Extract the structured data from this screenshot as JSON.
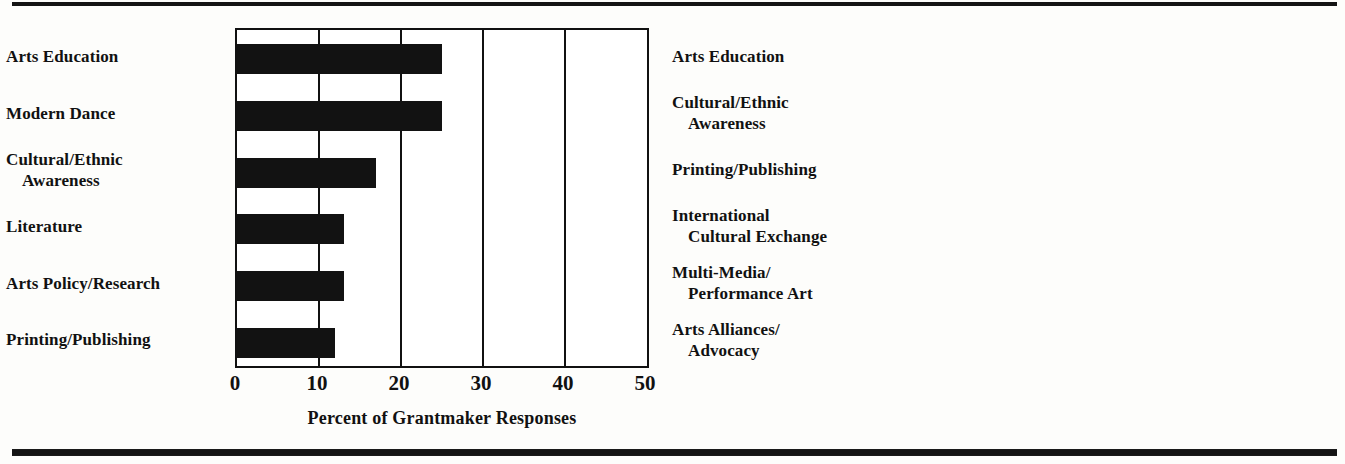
{
  "figure": {
    "background_color": "#fdfdfb",
    "rule_color": "#141414",
    "panels": [
      {
        "id": "grantmaker",
        "axis_title": "Percent of Grantmaker Responses",
        "bar_style": "solid-black",
        "bar_color": "#121212"
      },
      {
        "id": "grantee",
        "axis_title": "Percent of Grantee Responses",
        "bar_style": "checkered-gray",
        "bar_color": "#4a4a4a"
      }
    ]
  },
  "chart_data": [
    {
      "type": "bar",
      "orientation": "horizontal",
      "title": "",
      "xlabel": "Percent of Grantmaker Responses",
      "ylabel": "",
      "xlim": [
        0,
        50
      ],
      "xticks": [
        0,
        10,
        20,
        30,
        40,
        50
      ],
      "xtick_labels": [
        "0",
        "10",
        "20",
        "30",
        "40",
        "50"
      ],
      "grid": true,
      "legend": "none",
      "categories": [
        "Arts Education",
        "Modern Dance",
        "Cultural/Ethnic Awareness",
        "Literature",
        "Arts Policy/Research",
        "Printing/Publishing"
      ],
      "category_lines": [
        [
          "Arts Education"
        ],
        [
          "Modern Dance"
        ],
        [
          "Cultural/Ethnic",
          "Awareness"
        ],
        [
          "Literature"
        ],
        [
          "Arts Policy/Research"
        ],
        [
          "Printing/Publishing"
        ]
      ],
      "values": [
        25,
        25,
        17,
        13,
        13,
        12
      ]
    },
    {
      "type": "bar",
      "orientation": "horizontal",
      "title": "",
      "xlabel": "Percent of Grantee Responses",
      "ylabel": "",
      "xlim": [
        0,
        50
      ],
      "xticks": [
        0,
        10,
        20,
        30,
        40,
        50
      ],
      "xtick_labels": [
        "0",
        "10",
        "20",
        "30",
        "40",
        "50"
      ],
      "grid": true,
      "legend": "none",
      "categories": [
        "Arts Education",
        "Cultural/Ethnic Awareness",
        "Printing/Publishing",
        "International Cultural Exchange",
        "Multi-Media/Performance Art",
        "Arts Alliances/Advocacy"
      ],
      "category_lines": [
        [
          "Arts Education"
        ],
        [
          "Cultural/Ethnic",
          "Awareness"
        ],
        [
          "Printing/Publishing"
        ],
        [
          "International",
          "Cultural Exchange"
        ],
        [
          "Multi-Media/",
          "Performance Art"
        ],
        [
          "Arts Alliances/",
          "Advocacy"
        ]
      ],
      "values": [
        42,
        27,
        24,
        23,
        22,
        21
      ]
    }
  ]
}
